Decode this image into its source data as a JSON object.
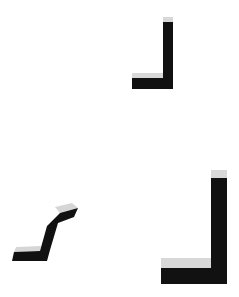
{
  "scene": {
    "description": "Three black L-shaped strokes with light gray bevel highlights on a white background",
    "colors": {
      "background": "#ffffff",
      "stroke": "#111111",
      "highlight": "#d6d6d6"
    },
    "shapes": [
      {
        "name": "small-l-shape",
        "kind": "L-bracket"
      },
      {
        "name": "slanted-z-shape",
        "kind": "slanted-step"
      },
      {
        "name": "large-l-shape",
        "kind": "L-bracket"
      }
    ]
  }
}
